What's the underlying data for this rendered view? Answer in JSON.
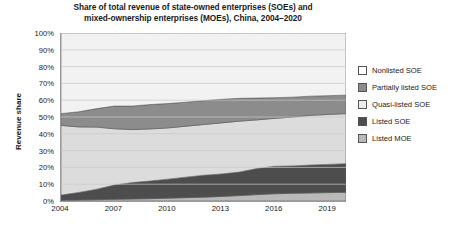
{
  "chart_data": {
    "type": "area",
    "title": "Share of total  revenue of state-owned enterprises (SOEs) and mixed-ownership enterprises (MOEs), China, 2004–2020",
    "title_line1": "Share of total  revenue of state-owned enterprises (SOEs) and",
    "title_line2": "mixed-ownership enterprises (MOEs), China, 2004–2020",
    "xlabel": "",
    "ylabel": "Revenue share",
    "stacked": true,
    "normalized_percent": true,
    "grid": true,
    "legend_position": "right",
    "ylim": [
      0,
      100
    ],
    "xlim": [
      2004,
      2020
    ],
    "ytick_labels": [
      "100%",
      "90%",
      "80%",
      "70%",
      "60%",
      "50%",
      "40%",
      "30%",
      "20%",
      "10%",
      "0%"
    ],
    "ytick_values": [
      100,
      90,
      80,
      70,
      60,
      50,
      40,
      30,
      20,
      10,
      0
    ],
    "xtick_labels": [
      "2004",
      "2007",
      "2010",
      "2013",
      "2016",
      "2019"
    ],
    "xtick_values": [
      2004,
      2007,
      2010,
      2013,
      2016,
      2019
    ],
    "x": [
      2004,
      2005,
      2006,
      2007,
      2008,
      2009,
      2010,
      2011,
      2012,
      2013,
      2014,
      2015,
      2016,
      2017,
      2018,
      2019,
      2020
    ],
    "series": [
      {
        "name": "Listed MOE",
        "color": "#b9b9b9",
        "values": [
          0.5,
          0.6,
          0.8,
          1.0,
          1.2,
          1.4,
          1.7,
          2.0,
          2.3,
          2.7,
          3.2,
          3.8,
          4.3,
          4.6,
          4.8,
          5.0,
          5.2
        ]
      },
      {
        "name": "Listed SOE",
        "color": "#4d4d4d",
        "values": [
          3.0,
          4.5,
          6.2,
          8.5,
          9.8,
          10.5,
          11.3,
          12.2,
          13.0,
          13.4,
          14.0,
          15.5,
          16.4,
          16.3,
          16.6,
          16.8,
          17.0
        ]
      },
      {
        "name": "Quasi-listed SOE",
        "color": "#dcdcdc",
        "values": [
          41.5,
          39.0,
          37.0,
          33.5,
          31.5,
          31.0,
          30.5,
          30.3,
          30.2,
          30.4,
          30.3,
          29.0,
          28.5,
          29.1,
          29.6,
          29.7,
          29.8
        ]
      },
      {
        "name": "Partially listed SOE",
        "color": "#8c8c8c",
        "values": [
          7.0,
          9.0,
          11.0,
          13.5,
          14.0,
          14.5,
          14.5,
          14.3,
          14.2,
          14.0,
          13.6,
          13.0,
          12.3,
          11.8,
          11.4,
          11.2,
          11.0
        ]
      },
      {
        "name": "Nonlisted SOE",
        "color": "#f2f2f2",
        "values": [
          48.0,
          46.9,
          45.0,
          43.5,
          43.5,
          42.6,
          42.0,
          41.2,
          40.3,
          39.5,
          38.9,
          38.7,
          38.5,
          38.2,
          37.6,
          37.3,
          37.0
        ]
      }
    ],
    "legend_order": [
      "Nonlisted SOE",
      "Partially listed SOE",
      "Quasi-listed SOE",
      "Listed SOE",
      "Listed MOE"
    ],
    "legend_colors": {
      "Nonlisted SOE": "#ffffff",
      "Partially listed SOE": "#8c8c8c",
      "Quasi-listed SOE": "#ececec",
      "Listed SOE": "#4d4d4d",
      "Listed MOE": "#b9b9b9"
    }
  }
}
